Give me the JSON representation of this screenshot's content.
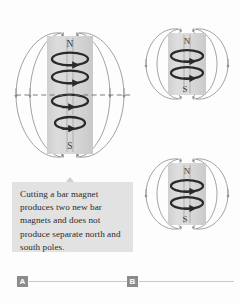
{
  "figure": {
    "title_present": false,
    "background_color": "#fdfdfd",
    "magnet_body_color": "#d8d8d8",
    "field_line_color": "#8a8a8a",
    "current_loop_color": "#2a2a2a",
    "cut_line_color": "#6e6e6e"
  },
  "caption": {
    "text": "Cutting a bar magnet produces two new bar magnets and does not produce separate north and south poles.",
    "background_color": "#e2e2e2",
    "text_color": "#2b2b2b"
  },
  "panels": [
    {
      "label": "A",
      "description": "single bar magnet with dashed cut line",
      "magnet": {
        "north_label": "N",
        "south_label": "S",
        "current_loop_count": 4
      },
      "cut_line": {
        "style": "dashed",
        "present": true
      }
    },
    {
      "label": "B",
      "description": "two resulting bar magnets after cutting",
      "magnets": [
        {
          "north_label": "N",
          "south_label": "S",
          "current_loop_count": 2
        },
        {
          "north_label": "N",
          "south_label": "S",
          "current_loop_count": 2
        }
      ]
    }
  ],
  "labels": {
    "panel_a": "A",
    "panel_b": "B",
    "north": "N",
    "south": "S"
  }
}
